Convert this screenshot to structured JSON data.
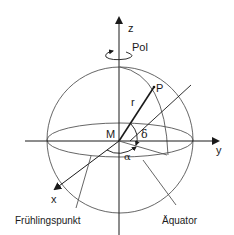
{
  "diagram": {
    "labels": {
      "z_axis": "z",
      "y_axis": "y",
      "x_axis": "x",
      "pole": "Pol",
      "point": "P",
      "radius": "r",
      "center": "M",
      "declination": "δ",
      "right_ascension": "α",
      "vernal_equinox": "Frühlingspunkt",
      "equator": "Äquator"
    },
    "colors": {
      "stroke": "#1a1a1a",
      "background": "#ffffff"
    }
  }
}
